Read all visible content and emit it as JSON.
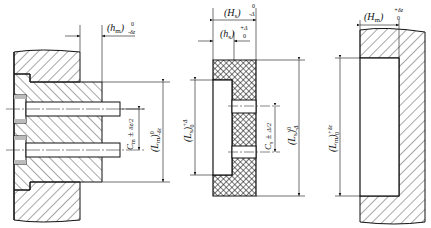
{
  "diagram": {
    "type": "engineering-drawing",
    "views": [
      {
        "id": "mold-assembly",
        "description": "Mold cross-section with two guide pins",
        "dimensions": {
          "height_tol": {
            "symbol": "(h",
            "sub": "m",
            "close": ")",
            "upper": "0",
            "lower": "-δz"
          },
          "pin_spacing": {
            "symbol": "C",
            "sub": "m",
            "tol": "± δz/2"
          },
          "length_tol": {
            "symbol": "(L",
            "sub": "m",
            "close": ")",
            "upper": "0",
            "lower": "-δz"
          }
        }
      },
      {
        "id": "grinding-insert",
        "description": "Crosshatched insert with slot and two holes",
        "dimensions": {
          "overall_height": {
            "symbol": "(H",
            "sub": "s",
            "close": ")",
            "upper": "0",
            "lower": "-Δ"
          },
          "step_height": {
            "symbol": "(h",
            "sub": "s",
            "close": ")",
            "upper": "+Δ",
            "lower": "0"
          },
          "slot_length": {
            "symbol": "(L",
            "sub": "s",
            "close": ")",
            "upper": "+Δ",
            "lower": "0"
          },
          "hole_spacing": {
            "symbol": "C",
            "sub": "s",
            "tol": "± Δ/2"
          },
          "overall_length": {
            "symbol": "(L",
            "sub": "s",
            "close": ")",
            "upper": "0",
            "lower": "-Δ"
          }
        }
      },
      {
        "id": "cavity-block",
        "description": "Hatched block with rectangular recess",
        "dimensions": {
          "cavity_depth": {
            "symbol": "(H",
            "sub": "m",
            "close": ")",
            "upper": "+δz",
            "lower": "0"
          },
          "cavity_length": {
            "symbol": "(L",
            "sub": "m",
            "close": ")",
            "upper": "+δz",
            "lower": "0"
          }
        }
      }
    ]
  },
  "labels": {
    "hm": "(hm)",
    "hm_tol_upper": "0",
    "hm_tol_lower": "-δz",
    "cm": "Cm ± δz/2",
    "lm_left": "(Lm)",
    "lm_left_upper": "0",
    "lm_left_lower": "-δz",
    "Hs": "(Hs)",
    "Hs_upper": "0",
    "Hs_lower": "-Δ",
    "hs": "(hs)",
    "hs_upper": "+Δ",
    "hs_lower": "0",
    "Ls_inner": "(Ls)",
    "Ls_inner_upper": "+Δ",
    "Ls_inner_lower": "0",
    "cs": "Cs ± Δ/2",
    "Ls_outer": "(Ls)",
    "Ls_outer_upper": "0",
    "Ls_outer_lower": "-Δ",
    "Hm": "(Hm)",
    "Hm_upper": "+δz",
    "Hm_lower": "0",
    "Lm_right": "(Lm)",
    "Lm_right_upper": "+δz",
    "Lm_right_lower": "0"
  }
}
